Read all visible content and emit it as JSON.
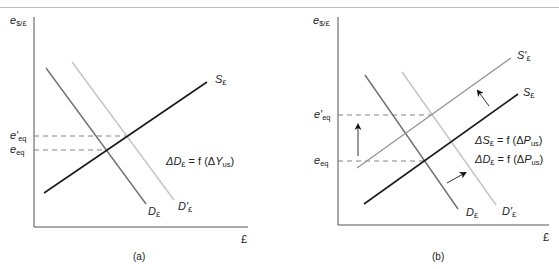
{
  "figure": {
    "panels": [
      {
        "caption": "(a)",
        "y_axis_label": {
          "base": "e",
          "sub": "$/£"
        },
        "x_axis_label": "£",
        "levels": [
          {
            "base": "e′",
            "sub": "eq"
          },
          {
            "base": "e",
            "sub": "eq"
          }
        ],
        "curves": [
          {
            "name": "S",
            "sub": "£"
          },
          {
            "name": "D",
            "sub": "£"
          },
          {
            "name": "D′",
            "sub": "£"
          }
        ],
        "annotations": [
          {
            "lhs": "ΔD",
            "lhs_sub": "£",
            "eq": " = f (Δ",
            "var": "Y",
            "var_sub": "us",
            "close": ")"
          }
        ]
      },
      {
        "caption": "(b)",
        "y_axis_label": {
          "base": "e",
          "sub": "$/£"
        },
        "x_axis_label": "£",
        "levels": [
          {
            "base": "e′",
            "sub": "eq"
          },
          {
            "base": "e",
            "sub": "eq"
          }
        ],
        "curves": [
          {
            "name": "S′",
            "sub": "£"
          },
          {
            "name": "S",
            "sub": "£"
          },
          {
            "name": "D",
            "sub": "£"
          },
          {
            "name": "D′",
            "sub": "£"
          }
        ],
        "annotations": [
          {
            "lhs": "ΔS",
            "lhs_sub": "£",
            "eq": " = f (Δ",
            "var": "P",
            "var_sub": "us",
            "close": ")"
          },
          {
            "lhs": "ΔD",
            "lhs_sub": "£",
            "eq": " = f (Δ",
            "var": "P",
            "var_sub": "us",
            "close": ")"
          }
        ]
      }
    ],
    "colors": {
      "axis": "#555555",
      "supply": "#1a1a1a",
      "supply_shifted": "#9a9a9a",
      "demand": "#707070",
      "demand_shifted": "#c4c4c4",
      "dashed": "#666666"
    }
  }
}
